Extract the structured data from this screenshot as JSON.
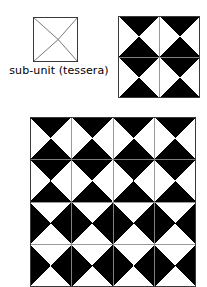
{
  "figure": {
    "background_color": "#ffffff",
    "ink_color": "#000000",
    "outline_color": "#3a3a3a",
    "diagonal_color": "#555555",
    "width": 207,
    "height": 287
  },
  "key": {
    "caption": "sub-unit (tessera)",
    "shape": "square-with-both-diagonals",
    "icon_name": "tessera-outline-icon",
    "size_px": 45,
    "stroke_color": "#3a3a3a",
    "diagonal_stroke_color": "#555555",
    "fill": "#ffffff"
  },
  "small_pattern": {
    "name": "two-by-two-tessera-block",
    "columns": 2,
    "rows": 2,
    "cell_size_px": 41,
    "orientation_legend": {
      "A": "black top and bottom triangles, white left and right triangles",
      "B": "white top and bottom triangles, black left and right triangles"
    },
    "grid": [
      [
        "A",
        "A"
      ],
      [
        "A",
        "A"
      ]
    ]
  },
  "large_pattern": {
    "name": "four-by-four-tessera-block",
    "columns": 4,
    "rows": 4,
    "cell_width_px": 41.5,
    "cell_height_px": 42.5,
    "orientation_legend": {
      "A": "black top and bottom triangles, white left and right triangles",
      "B": "white top and bottom triangles, black left and right triangles"
    },
    "grid": [
      [
        "A",
        "A",
        "A",
        "A"
      ],
      [
        "A",
        "A",
        "A",
        "A"
      ],
      [
        "B",
        "B",
        "B",
        "B"
      ],
      [
        "B",
        "B",
        "B",
        "B"
      ]
    ]
  },
  "colors": {
    "black": "#000000",
    "white": "#ffffff",
    "outline": "#3a3a3a",
    "diagonal": "#555555"
  }
}
